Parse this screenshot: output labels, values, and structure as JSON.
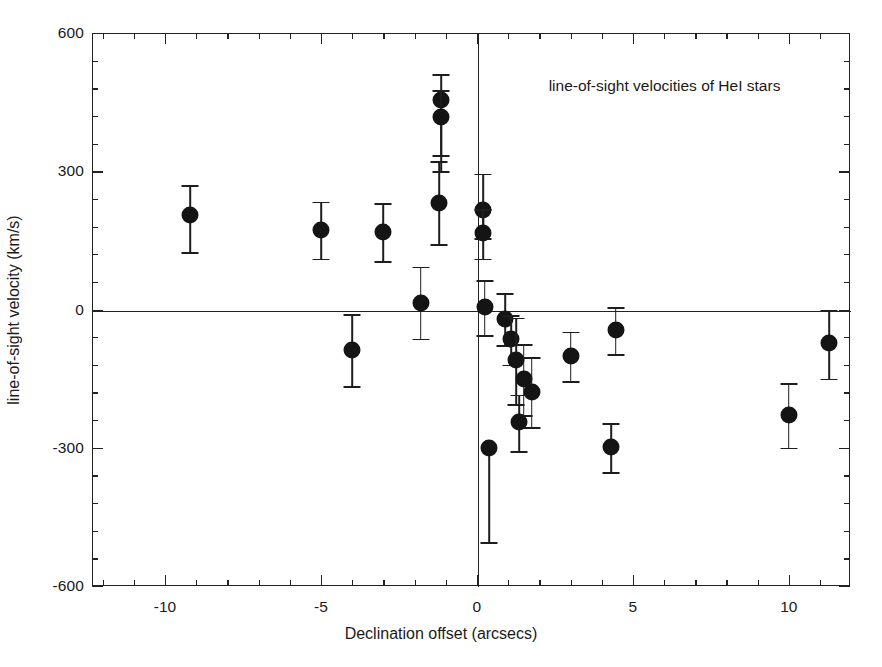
{
  "chart_data": {
    "type": "scatter",
    "title": "",
    "annotation": "line-of-sight velocities of HeI stars",
    "xlabel": "Declination offset (arcsecs)",
    "ylabel": "line-of-sight velocity (km/s)",
    "xlim": [
      -12.34,
      11.96
    ],
    "ylim": [
      -600,
      600
    ],
    "xticks": [
      -10,
      -5,
      0,
      5,
      10
    ],
    "xticklabels": [
      "-10",
      "-5",
      "0",
      "5",
      "10"
    ],
    "yticks": [
      600,
      300,
      0,
      -300,
      -600
    ],
    "yticklabels": [
      "600",
      "300",
      "0",
      "-300",
      "-600"
    ],
    "xminorstep": 1,
    "yminorstep": 60,
    "grid": false,
    "legend": null,
    "zero_lines": {
      "horizontal": 0,
      "vertical": 0
    },
    "marker": {
      "shape": "circle",
      "color": "#141414",
      "size_px": 17
    },
    "errorbars": "vertical, symmetric unless noted",
    "points": [
      {
        "x": -9.2,
        "y": 205,
        "yerr_low": 80,
        "yerr_high": 65
      },
      {
        "x": -5.0,
        "y": 172,
        "yerr_low": 62,
        "yerr_high": 62
      },
      {
        "x": -3.0,
        "y": 168,
        "yerr_low": 63,
        "yerr_high": 63
      },
      {
        "x": -4.0,
        "y": -88,
        "yerr_low": 78,
        "yerr_high": 78
      },
      {
        "x": -1.8,
        "y": 15,
        "yerr_low": 78,
        "yerr_high": 78
      },
      {
        "x": -1.2,
        "y": 232,
        "yerr_low": 90,
        "yerr_high": 90
      },
      {
        "x": -1.15,
        "y": 455,
        "yerr_low": 120,
        "yerr_high": 55
      },
      {
        "x": -1.15,
        "y": 418,
        "yerr_low": 118,
        "yerr_high": 58
      },
      {
        "x": 0.2,
        "y": 215,
        "yerr_low": 60,
        "yerr_high": 80
      },
      {
        "x": 0.2,
        "y": 165,
        "yerr_low": 55,
        "yerr_high": 52
      },
      {
        "x": 0.25,
        "y": 5,
        "yerr_low": 60,
        "yerr_high": 58
      },
      {
        "x": 0.9,
        "y": -20,
        "yerr_low": 58,
        "yerr_high": 55
      },
      {
        "x": 1.1,
        "y": -65,
        "yerr_low": 55,
        "yerr_high": 52
      },
      {
        "x": 1.25,
        "y": -110,
        "yerr_low": 95,
        "yerr_high": 92
      },
      {
        "x": 1.5,
        "y": -150,
        "yerr_low": 80,
        "yerr_high": 75
      },
      {
        "x": 1.75,
        "y": -178,
        "yerr_low": 78,
        "yerr_high": 75
      },
      {
        "x": 1.35,
        "y": -245,
        "yerr_low": 62,
        "yerr_high": 60
      },
      {
        "x": 0.4,
        "y": -300,
        "yerr_low": 205,
        "yerr_high": 0
      },
      {
        "x": 3.0,
        "y": -100,
        "yerr_low": 55,
        "yerr_high": 52
      },
      {
        "x": 4.45,
        "y": -45,
        "yerr_low": 52,
        "yerr_high": 50
      },
      {
        "x": 4.3,
        "y": -298,
        "yerr_low": 55,
        "yerr_high": 52
      },
      {
        "x": 10.0,
        "y": -228,
        "yerr_low": 72,
        "yerr_high": 68
      },
      {
        "x": 11.3,
        "y": -72,
        "yerr_low": 78,
        "yerr_high": 72
      }
    ]
  }
}
